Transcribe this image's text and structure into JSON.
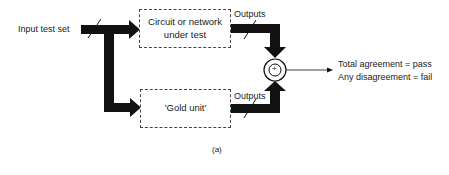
{
  "diagram": {
    "input_label": "Input test set",
    "top_box": {
      "line1": "Circuit or network",
      "line2": "under test"
    },
    "bottom_box": {
      "label": "'Gold unit'"
    },
    "top_outputs_label": "Outputs",
    "bottom_outputs_label": "Outputs",
    "comparator_symbol": "+",
    "result_lines": [
      "Total agreement = pass",
      "Any disagreement = fail"
    ],
    "caption": "(a)"
  },
  "colors": {
    "arrow": "#111111",
    "text": "#222222",
    "background": "#ffffff"
  }
}
